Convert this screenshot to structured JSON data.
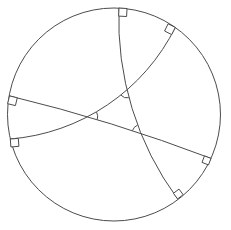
{
  "canvas": {
    "width": 231,
    "height": 230,
    "background": "#ffffff",
    "line_color": "#4c4c4c",
    "line_width": 1
  },
  "diagram": {
    "type": "circle-with-orthogonal-arcs",
    "boundary_circle": {
      "cx": 114,
      "cy": 114.5,
      "r": 106.5
    },
    "geodesics": [
      {
        "name": "geodesic-vertical",
        "start": [
          119,
          8.1
        ],
        "end": [
          177.6,
          198.9
        ],
        "r": 301,
        "sweep": 0
      },
      {
        "name": "geodesic-ascending",
        "start": [
          10.3,
          139
        ],
        "end": [
          175.3,
          27.4
        ],
        "r": 202,
        "sweep": 0
      },
      {
        "name": "geodesic-descending",
        "start": [
          9.5,
          95.9
        ],
        "end": [
          211,
          158.4
        ],
        "r": 1648.7,
        "sweep": 1
      }
    ],
    "right_angle_markers": [
      {
        "name": "right-angle-top",
        "points": [
          [
            119,
            8.1
          ],
          [
            118.6,
            16.1
          ],
          [
            126.6,
            16.5
          ],
          [
            127,
            8.5
          ]
        ]
      },
      {
        "name": "right-angle-top-right",
        "points": [
          [
            175.3,
            27.4
          ],
          [
            171.7,
            34.6
          ],
          [
            164.6,
            31.0
          ],
          [
            168.1,
            23.8
          ]
        ]
      },
      {
        "name": "right-angle-left-upper",
        "points": [
          [
            9.5,
            95.9
          ],
          [
            17.3,
            97.8
          ],
          [
            15.4,
            105.6
          ],
          [
            7.6,
            103.7
          ]
        ]
      },
      {
        "name": "right-angle-left-lower",
        "points": [
          [
            10.3,
            139
          ],
          [
            18.3,
            138.4
          ],
          [
            18.9,
            146.3
          ],
          [
            10.9,
            147.0
          ]
        ]
      },
      {
        "name": "right-angle-right",
        "points": [
          [
            211,
            158.4
          ],
          [
            204.5,
            155.9
          ],
          [
            202.0,
            162.4
          ],
          [
            208.5,
            164.9
          ]
        ]
      },
      {
        "name": "right-angle-bottom",
        "points": [
          [
            177.6,
            198.9
          ],
          [
            173.4,
            193.3
          ],
          [
            179.0,
            189.1
          ],
          [
            183.2,
            194.7
          ]
        ]
      }
    ],
    "angle_markers": [
      {
        "name": "angle-top-vertex",
        "cx": 127.0,
        "cy": 89.9,
        "r": 8,
        "a1": 76.6,
        "a2": 138.9
      },
      {
        "name": "angle-left-vertex",
        "cx": 87.7,
        "cy": 116.7,
        "r": 10,
        "a1": -27.6,
        "a2": 16.4
      },
      {
        "name": "angle-right-vertex",
        "cx": 141.0,
        "cy": 133.4,
        "r": 9,
        "a1": 198.3,
        "a2": 247.9
      }
    ]
  }
}
